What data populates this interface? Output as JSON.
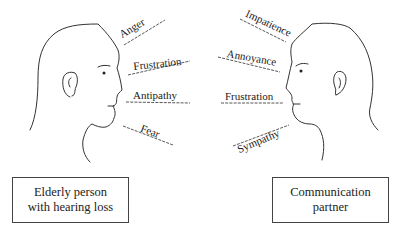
{
  "figure": {
    "left_person": {
      "label_line1": "Elderly person",
      "label_line2": "with hearing loss",
      "emotions": [
        "Anger",
        "Frustration",
        "Antipathy",
        "Fear"
      ]
    },
    "right_person": {
      "label_line1": "Communication",
      "label_line2": "partner",
      "emotions": [
        "Impatience",
        "Annoyance",
        "Frustration",
        "Sympathy"
      ]
    },
    "colors": {
      "line": "#333333",
      "text": "#222222",
      "background": "#ffffff"
    }
  }
}
